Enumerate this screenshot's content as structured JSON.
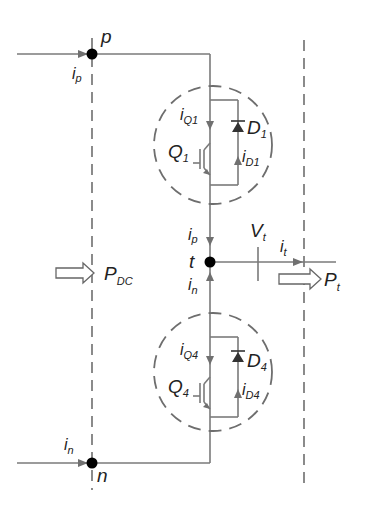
{
  "diagram": {
    "type": "circuit",
    "nodes": {
      "p": "p",
      "n": "n",
      "t": "t"
    },
    "currents": {
      "ip": {
        "base": "i",
        "sub": "p"
      },
      "in_top": {
        "base": "i",
        "sub": "n"
      },
      "ip_mid": {
        "base": "i",
        "sub": "p"
      },
      "in_mid": {
        "base": "i",
        "sub": "n"
      },
      "iQ1": {
        "base": "i",
        "sub": "Q1"
      },
      "iD1": {
        "base": "i",
        "sub": "D1"
      },
      "iQ4": {
        "base": "i",
        "sub": "Q4"
      },
      "iD4": {
        "base": "i",
        "sub": "D4"
      },
      "it": {
        "base": "i",
        "sub": "t"
      }
    },
    "components": {
      "Q1": {
        "base": "Q",
        "sub": "1"
      },
      "D1": {
        "base": "D",
        "sub": "1"
      },
      "Q4": {
        "base": "Q",
        "sub": "4"
      },
      "D4": {
        "base": "D",
        "sub": "4"
      }
    },
    "voltages": {
      "Vt": {
        "base": "V",
        "sub": "t"
      }
    },
    "powers": {
      "PDC": {
        "base": "P",
        "sub": "DC"
      },
      "Pt": {
        "base": "P",
        "sub": "t"
      }
    }
  }
}
